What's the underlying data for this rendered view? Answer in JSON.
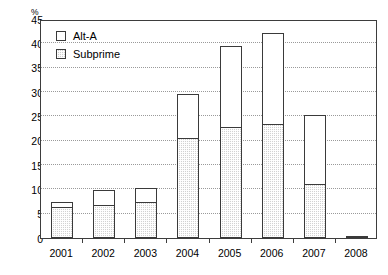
{
  "chart_data": {
    "type": "bar",
    "stacked": true,
    "title": "",
    "subtitle": "",
    "xlabel": "",
    "ylabel": "%",
    "y_unit_label": "%",
    "categories": [
      "2001",
      "2002",
      "2003",
      "2004",
      "2005",
      "2006",
      "2007",
      "2008"
    ],
    "series": [
      {
        "name": "Subprime",
        "values": [
          6.5,
          6.9,
          7.5,
          20.6,
          22.8,
          23.4,
          11.2,
          0.3
        ]
      },
      {
        "name": "Alt-A",
        "values": [
          0.9,
          3.0,
          2.7,
          9.0,
          16.7,
          18.7,
          14.1,
          0.0
        ]
      }
    ],
    "totals": [
      7.4,
      9.9,
      10.2,
      29.6,
      39.5,
      42.1,
      25.3,
      0.3
    ],
    "ylim": [
      0,
      45
    ],
    "ytick_values": [
      0,
      5,
      10,
      15,
      20,
      25,
      30,
      35,
      40,
      45
    ],
    "ytick_labels": [
      "0",
      "5",
      "10",
      "15",
      "20",
      "25",
      "30",
      "35",
      "40",
      "45"
    ],
    "grid": true,
    "grid_axis": "y",
    "legend_position": "top-left",
    "legend": [
      {
        "label": "Alt-A",
        "swatch": "white-square"
      },
      {
        "label": "Subprime",
        "swatch": "hatched-square"
      }
    ],
    "colors": {
      "alt_a": "#ffffff",
      "subprime": "#d2d2d2",
      "axis": "#3d3d3d",
      "grid": "#9a9a9a",
      "bar_outline": "#3a3a3a",
      "text": "#000000",
      "background": "#ffffff"
    }
  }
}
